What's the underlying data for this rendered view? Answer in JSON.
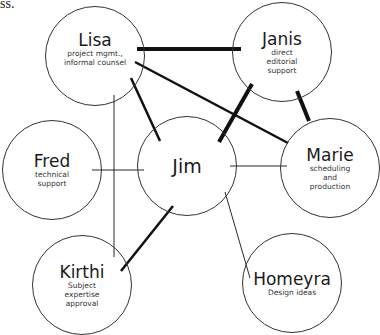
{
  "fragment_text": "ss.",
  "nodes": [
    {
      "id": "lisa",
      "name": "Lisa",
      "role": "project mgmt., informal counsel",
      "cx": 95,
      "cy": 56
    },
    {
      "id": "janis",
      "name": "Janis",
      "role": "direct editorial support",
      "cx": 282,
      "cy": 52
    },
    {
      "id": "fred",
      "name": "Fred",
      "role": "technical support",
      "cx": 52,
      "cy": 170
    },
    {
      "id": "jim",
      "name": "Jim",
      "role": "",
      "cx": 187,
      "cy": 166
    },
    {
      "id": "marie",
      "name": "Marie",
      "role": "scheduling and production",
      "cx": 330,
      "cy": 168
    },
    {
      "id": "kirthi",
      "name": "Kirthi",
      "role": "Subject expertise approval",
      "cx": 82,
      "cy": 285
    },
    {
      "id": "homeyra",
      "name": "Homeyra",
      "role": "Design ideas",
      "cx": 292,
      "cy": 283
    }
  ],
  "edges": [
    {
      "from": "lisa",
      "to": "janis",
      "weight": "thick"
    },
    {
      "from": "lisa",
      "to": "marie",
      "weight": "medium"
    },
    {
      "from": "lisa",
      "to": "jim",
      "weight": "medium"
    },
    {
      "from": "janis",
      "to": "jim",
      "weight": "thick"
    },
    {
      "from": "janis",
      "to": "marie",
      "weight": "thick"
    },
    {
      "from": "fred",
      "to": "jim",
      "weight": "thin"
    },
    {
      "from": "lisa",
      "to": "kirthi",
      "weight": "thin"
    },
    {
      "from": "jim",
      "to": "marie",
      "weight": "thin"
    },
    {
      "from": "jim",
      "to": "kirthi",
      "weight": "medium"
    },
    {
      "from": "jim",
      "to": "homeyra",
      "weight": "thin"
    }
  ],
  "labels": {
    "lisa": {
      "name": "Lisa",
      "role_line1": "project mgmt.,",
      "role_line2": "informal counsel"
    },
    "janis": {
      "name": "Janis",
      "role_line1": "direct",
      "role_line2": "editorial",
      "role_line3": "support"
    },
    "fred": {
      "name": "Fred",
      "role_line1": "technical",
      "role_line2": "support"
    },
    "jim": {
      "name": "Jim"
    },
    "marie": {
      "name": "Marie",
      "role_line1": "scheduling",
      "role_line2": "and",
      "role_line3": "production"
    },
    "kirthi": {
      "name": "Kirthi",
      "role_line1": "Subject",
      "role_line2": "expertise",
      "role_line3": "approval"
    },
    "homeyra": {
      "name": "Homeyra",
      "role_line1": "Design ideas"
    }
  }
}
